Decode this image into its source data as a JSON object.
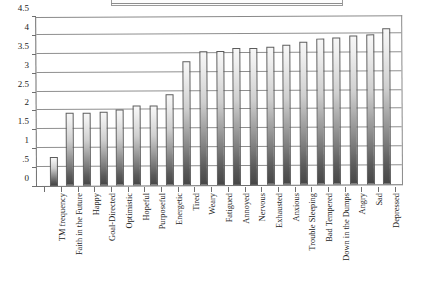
{
  "chart_data": {
    "type": "bar",
    "title": "",
    "subtitle": "",
    "xlabel": "",
    "ylabel": "",
    "ylim": [
      0,
      4.5
    ],
    "grid": true,
    "legend": "none",
    "ytick_labels": [
      "0",
      ".5",
      "1",
      "1.5",
      "2",
      "2.5",
      "3",
      "3.5",
      "4",
      "4.5"
    ],
    "ytick_values": [
      0,
      0.5,
      1,
      1.5,
      2,
      2.5,
      3,
      3.5,
      4,
      4.5
    ],
    "categories": [
      "TM frequency",
      "Faith in the Future",
      "Happy",
      "Goal-Directed",
      "Optimistic",
      "Hopeful",
      "Purposeful",
      "Energetic",
      "Tired",
      "Weary",
      "Fatigued",
      "Annoyed",
      "Nervous",
      "Exhausted",
      "Anxious",
      "Trouble Sleeping",
      "Bad Tempered",
      "Down in the Dumps",
      "Angry",
      "Sad",
      "Depressed"
    ],
    "values": [
      0.77,
      1.93,
      1.94,
      1.97,
      2.02,
      2.11,
      2.13,
      2.42,
      3.29,
      3.54,
      3.56,
      3.62,
      3.64,
      3.66,
      3.71,
      3.78,
      3.86,
      3.88,
      3.94,
      3.98,
      4.12
    ],
    "bar_color": "#9a9a9a",
    "bar_edge_color": "#5c5c5c",
    "grid_color": "#8f8f8f",
    "axis_color": "#6f6f6f"
  }
}
